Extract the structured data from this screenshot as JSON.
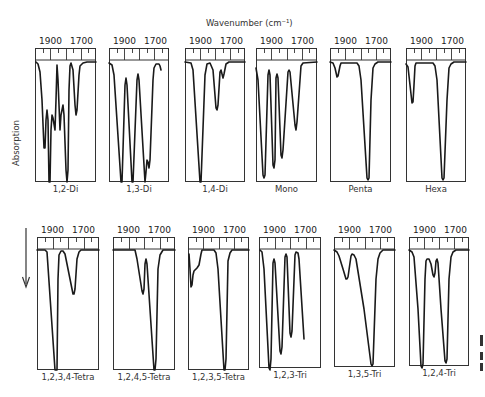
{
  "figure": {
    "x_axis_title": "Wavenumber (cm⁻¹)",
    "y_axis_title": "Absorption",
    "direction_arrow": "down-arrow"
  },
  "chart_data": {
    "type": "line",
    "xlabel": "Wavenumber (cm⁻¹)",
    "ylabel": "Absorption",
    "x_ticks": [
      "1900",
      "1700"
    ],
    "grid": false,
    "note": "Curve coordinates are relative to each panel: x in px from panel left (0–62), y in px below axis strip (0 = baseline, ~121 = max absorption)",
    "panels": [
      {
        "label": "1,2-Di",
        "row": 0,
        "x": 35,
        "y": 48,
        "w": 61,
        "h": 134,
        "points": [
          [
            1,
            2
          ],
          [
            3,
            4
          ],
          [
            5,
            12
          ],
          [
            7,
            40
          ],
          [
            9,
            88
          ],
          [
            10,
            88
          ],
          [
            11,
            60
          ],
          [
            12,
            50
          ],
          [
            13,
            60
          ],
          [
            14,
            122
          ],
          [
            15,
            122
          ],
          [
            16,
            70
          ],
          [
            17,
            55
          ],
          [
            18,
            58
          ],
          [
            20,
            70
          ],
          [
            21,
            40
          ],
          [
            22,
            5
          ],
          [
            23,
            20
          ],
          [
            25,
            70
          ],
          [
            26,
            55
          ],
          [
            28,
            45
          ],
          [
            29,
            55
          ],
          [
            31,
            110
          ],
          [
            32,
            122
          ],
          [
            33,
            110
          ],
          [
            34,
            30
          ],
          [
            35,
            6
          ],
          [
            36,
            3
          ],
          [
            38,
            10
          ],
          [
            40,
            45
          ],
          [
            41,
            55
          ],
          [
            42,
            50
          ],
          [
            44,
            15
          ],
          [
            45,
            6
          ],
          [
            48,
            3
          ],
          [
            52,
            2
          ],
          [
            61,
            2
          ]
        ]
      },
      {
        "label": "1,3-Di",
        "row": 0,
        "x": 109,
        "y": 48,
        "w": 60,
        "h": 134,
        "points": [
          [
            0,
            3
          ],
          [
            3,
            5
          ],
          [
            5,
            15
          ],
          [
            12,
            122
          ],
          [
            13,
            122
          ],
          [
            16,
            25
          ],
          [
            17,
            18
          ],
          [
            18,
            25
          ],
          [
            23,
            122
          ],
          [
            24,
            122
          ],
          [
            28,
            20
          ],
          [
            29,
            14
          ],
          [
            30,
            20
          ],
          [
            36,
            122
          ],
          [
            37,
            112
          ],
          [
            38,
            100
          ],
          [
            39,
            102
          ],
          [
            40,
            108
          ],
          [
            41,
            100
          ],
          [
            44,
            20
          ],
          [
            45,
            8
          ],
          [
            47,
            4
          ],
          [
            50,
            4
          ],
          [
            51,
            6
          ],
          [
            52,
            10
          ]
        ]
      },
      {
        "label": "1,4-Di",
        "row": 0,
        "x": 185,
        "y": 48,
        "w": 60,
        "h": 134,
        "points": [
          [
            0,
            2
          ],
          [
            6,
            3
          ],
          [
            8,
            10
          ],
          [
            15,
            122
          ],
          [
            16,
            122
          ],
          [
            20,
            15
          ],
          [
            22,
            4
          ],
          [
            25,
            3
          ],
          [
            28,
            10
          ],
          [
            31,
            48
          ],
          [
            32,
            50
          ],
          [
            33,
            45
          ],
          [
            35,
            12
          ],
          [
            36,
            10
          ],
          [
            37,
            14
          ],
          [
            38,
            18
          ],
          [
            39,
            14
          ],
          [
            41,
            4
          ],
          [
            44,
            2
          ],
          [
            60,
            2
          ]
        ]
      },
      {
        "label": "Mono",
        "row": 0,
        "x": 256,
        "y": 48,
        "w": 61,
        "h": 134,
        "points": [
          [
            0,
            8
          ],
          [
            2,
            20
          ],
          [
            7,
            115
          ],
          [
            8,
            118
          ],
          [
            9,
            115
          ],
          [
            12,
            15
          ],
          [
            13,
            10
          ],
          [
            14,
            15
          ],
          [
            17,
            105
          ],
          [
            18,
            108
          ],
          [
            19,
            100
          ],
          [
            20,
            18
          ],
          [
            21,
            14
          ],
          [
            22,
            18
          ],
          [
            25,
            95
          ],
          [
            26,
            98
          ],
          [
            27,
            90
          ],
          [
            32,
            12
          ],
          [
            33,
            10
          ],
          [
            34,
            12
          ],
          [
            39,
            65
          ],
          [
            40,
            70
          ],
          [
            41,
            62
          ],
          [
            45,
            6
          ],
          [
            47,
            3
          ],
          [
            61,
            2
          ]
        ]
      },
      {
        "label": "Penta",
        "row": 0,
        "x": 330,
        "y": 48,
        "w": 61,
        "h": 134,
        "points": [
          [
            0,
            2
          ],
          [
            3,
            3
          ],
          [
            5,
            8
          ],
          [
            7,
            17
          ],
          [
            8,
            16
          ],
          [
            10,
            6
          ],
          [
            11,
            3
          ],
          [
            27,
            3
          ],
          [
            29,
            6
          ],
          [
            31,
            20
          ],
          [
            37,
            118
          ],
          [
            38,
            120
          ],
          [
            39,
            118
          ],
          [
            41,
            40
          ],
          [
            43,
            8
          ],
          [
            45,
            4
          ],
          [
            48,
            2
          ],
          [
            61,
            2
          ]
        ]
      },
      {
        "label": "Hexa",
        "row": 0,
        "x": 406,
        "y": 48,
        "w": 60,
        "h": 134,
        "points": [
          [
            0,
            4
          ],
          [
            2,
            7
          ],
          [
            4,
            25
          ],
          [
            6,
            43
          ],
          [
            7,
            42
          ],
          [
            8,
            25
          ],
          [
            9,
            6
          ],
          [
            10,
            3
          ],
          [
            27,
            3
          ],
          [
            29,
            6
          ],
          [
            31,
            20
          ],
          [
            36,
            118
          ],
          [
            37,
            120
          ],
          [
            38,
            118
          ],
          [
            41,
            40
          ],
          [
            43,
            8
          ],
          [
            45,
            4
          ],
          [
            48,
            2
          ],
          [
            60,
            2
          ]
        ]
      },
      {
        "label": "1,2,3,4-Tetra",
        "row": 1,
        "x": 37,
        "y": 237,
        "w": 62,
        "h": 133,
        "points": [
          [
            0,
            1
          ],
          [
            8,
            1
          ],
          [
            10,
            3
          ],
          [
            18,
            121
          ],
          [
            19,
            121
          ],
          [
            20,
            121
          ],
          [
            21,
            30
          ],
          [
            22,
            6
          ],
          [
            24,
            2
          ],
          [
            26,
            2
          ],
          [
            28,
            5
          ],
          [
            32,
            25
          ],
          [
            36,
            45
          ],
          [
            37,
            45
          ],
          [
            38,
            40
          ],
          [
            40,
            10
          ],
          [
            42,
            3
          ],
          [
            44,
            1
          ],
          [
            62,
            1
          ]
        ]
      },
      {
        "label": "1,2,4,5-Tetra",
        "row": 1,
        "x": 113,
        "y": 237,
        "w": 62,
        "h": 133,
        "points": [
          [
            0,
            1
          ],
          [
            22,
            1
          ],
          [
            24,
            10
          ],
          [
            29,
            42
          ],
          [
            30,
            45
          ],
          [
            31,
            40
          ],
          [
            32,
            15
          ],
          [
            33,
            10
          ],
          [
            34,
            15
          ],
          [
            41,
            121
          ],
          [
            42,
            121
          ],
          [
            43,
            110
          ],
          [
            45,
            20
          ],
          [
            47,
            6
          ],
          [
            50,
            1
          ],
          [
            62,
            1
          ]
        ]
      },
      {
        "label": "1,2,3,5-Tetra",
        "row": 1,
        "x": 188,
        "y": 237,
        "w": 61,
        "h": 133,
        "points": [
          [
            1,
            5
          ],
          [
            2,
            20
          ],
          [
            3,
            38
          ],
          [
            4,
            36
          ],
          [
            5,
            26
          ],
          [
            6,
            22
          ],
          [
            9,
            19
          ],
          [
            11,
            16
          ],
          [
            13,
            5
          ],
          [
            14,
            1
          ],
          [
            26,
            1
          ],
          [
            28,
            4
          ],
          [
            30,
            20
          ],
          [
            36,
            121
          ],
          [
            37,
            121
          ],
          [
            38,
            110
          ],
          [
            40,
            12
          ],
          [
            42,
            4
          ],
          [
            44,
            1
          ],
          [
            61,
            1
          ]
        ]
      },
      {
        "label": "1,2,3-Tri",
        "row": 1,
        "x": 259,
        "y": 237,
        "w": 62,
        "h": 131,
        "points": [
          [
            1,
            1
          ],
          [
            3,
            3
          ],
          [
            5,
            20
          ],
          [
            10,
            119
          ],
          [
            11,
            121
          ],
          [
            12,
            110
          ],
          [
            14,
            14
          ],
          [
            15,
            10
          ],
          [
            16,
            14
          ],
          [
            21,
            102
          ],
          [
            22,
            105
          ],
          [
            23,
            98
          ],
          [
            26,
            8
          ],
          [
            27,
            5
          ],
          [
            28,
            8
          ],
          [
            31,
            84
          ],
          [
            32,
            88
          ],
          [
            33,
            82
          ],
          [
            36,
            6
          ],
          [
            37,
            3
          ],
          [
            39,
            4
          ],
          [
            40,
            10
          ],
          [
            45,
            90
          ]
        ]
      },
      {
        "label": "1,3,5-Tri",
        "row": 1,
        "x": 334,
        "y": 237,
        "w": 61,
        "h": 130,
        "points": [
          [
            0,
            1
          ],
          [
            3,
            3
          ],
          [
            5,
            7
          ],
          [
            9,
            20
          ],
          [
            12,
            30
          ],
          [
            13,
            30
          ],
          [
            14,
            28
          ],
          [
            17,
            7
          ],
          [
            18,
            5
          ],
          [
            20,
            6
          ],
          [
            22,
            10
          ],
          [
            30,
            60
          ],
          [
            37,
            115
          ],
          [
            38,
            117
          ],
          [
            39,
            115
          ],
          [
            42,
            30
          ],
          [
            44,
            10
          ],
          [
            46,
            4
          ],
          [
            49,
            1
          ],
          [
            61,
            1
          ]
        ]
      },
      {
        "label": "1,2,4-Tri",
        "row": 1,
        "x": 409,
        "y": 237,
        "w": 60,
        "h": 129,
        "points": [
          [
            0,
            1
          ],
          [
            3,
            3
          ],
          [
            5,
            8
          ],
          [
            9,
            60
          ],
          [
            12,
            117
          ],
          [
            13,
            119
          ],
          [
            14,
            115
          ],
          [
            16,
            30
          ],
          [
            17,
            12
          ],
          [
            18,
            10
          ],
          [
            20,
            10
          ],
          [
            22,
            15
          ],
          [
            24,
            26
          ],
          [
            25,
            28
          ],
          [
            26,
            24
          ],
          [
            27,
            12
          ],
          [
            28,
            10
          ],
          [
            29,
            14
          ],
          [
            32,
            60
          ],
          [
            36,
            112
          ],
          [
            37,
            114
          ],
          [
            38,
            110
          ],
          [
            40,
            30
          ],
          [
            42,
            8
          ],
          [
            44,
            3
          ],
          [
            47,
            1
          ],
          [
            60,
            1
          ]
        ]
      }
    ]
  }
}
